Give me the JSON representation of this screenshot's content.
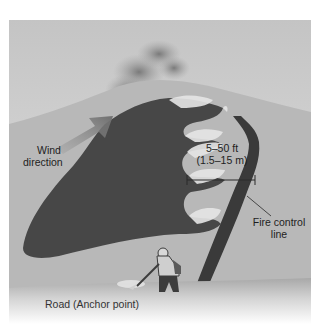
{
  "diagram": {
    "title": "",
    "labels": {
      "wind_direction_line1": "Wind",
      "wind_direction_line2": "direction",
      "distance_line1": "5–50 ft",
      "distance_line2": "(1.5–15 m)",
      "fire_control_line1": "Fire control",
      "fire_control_line2": "line",
      "road": "Road (Anchor point)"
    },
    "elements": [
      {
        "name": "sky-background",
        "color": "#c8c8c8"
      },
      {
        "name": "hill",
        "color": "#b4b4b4"
      },
      {
        "name": "burned-area",
        "color": "#4a4a4a"
      },
      {
        "name": "fire-flames",
        "color": "#e4e4e4"
      },
      {
        "name": "smoke-plume",
        "color": "#8a8a8a"
      },
      {
        "name": "wind-arrow",
        "color": "#7c7c7c"
      },
      {
        "name": "fire-control-line",
        "color": "#3a3a3a"
      },
      {
        "name": "firefighter",
        "color": "#3c3c3c"
      },
      {
        "name": "road",
        "color": "#d0d0d0"
      }
    ]
  }
}
